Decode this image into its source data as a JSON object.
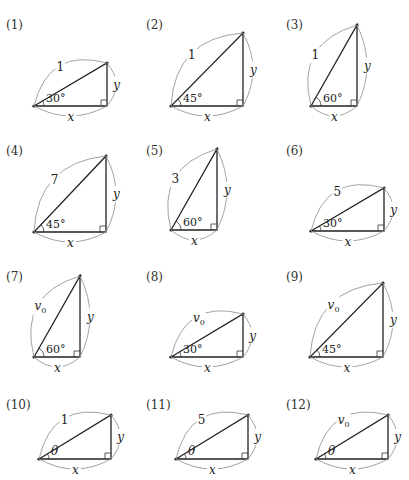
{
  "figure": {
    "colors": {
      "stroke": "#222222",
      "brace": "#999999",
      "background": "#ffffff"
    },
    "triangles": [
      {
        "number": "(1)",
        "hypotenuse": "1",
        "hyp_sub": "",
        "angle": "30°",
        "base_label": "x",
        "height_label": "y",
        "ax": 34,
        "ay": 106,
        "bx": 107,
        "ty": 63,
        "nx": 6,
        "ny": 20
      },
      {
        "number": "(2)",
        "hypotenuse": "1",
        "hyp_sub": "",
        "angle": "45°",
        "base_label": "x",
        "height_label": "y",
        "ax": 171,
        "ay": 106,
        "bx": 243,
        "ty": 33,
        "nx": 146,
        "ny": 20
      },
      {
        "number": "(3)",
        "hypotenuse": "1",
        "hyp_sub": "",
        "angle": "60°",
        "base_label": "x",
        "height_label": "y",
        "ax": 311,
        "ay": 106,
        "bx": 357,
        "ty": 25,
        "nx": 286,
        "ny": 20
      },
      {
        "number": "(4)",
        "hypotenuse": "7",
        "hyp_sub": "",
        "angle": "45°",
        "base_label": "x",
        "height_label": "y",
        "ax": 34,
        "ay": 232,
        "bx": 106,
        "ty": 156,
        "nx": 6,
        "ny": 146
      },
      {
        "number": "(5)",
        "hypotenuse": "3",
        "hyp_sub": "",
        "angle": "60°",
        "base_label": "x",
        "height_label": "y",
        "ax": 171,
        "ay": 230,
        "bx": 217,
        "ty": 149,
        "nx": 146,
        "ny": 146
      },
      {
        "number": "(6)",
        "hypotenuse": "5",
        "hyp_sub": "",
        "angle": "30°",
        "base_label": "x",
        "height_label": "y",
        "ax": 311,
        "ay": 231,
        "bx": 384,
        "ty": 188,
        "nx": 286,
        "ny": 146
      },
      {
        "number": "(7)",
        "hypotenuse": "v",
        "hyp_sub": "0",
        "angle": "60°",
        "base_label": "x",
        "height_label": "y",
        "ax": 34,
        "ay": 357,
        "bx": 80,
        "ty": 276,
        "nx": 6,
        "ny": 272
      },
      {
        "number": "(8)",
        "hypotenuse": "v",
        "hyp_sub": "0",
        "angle": "30°",
        "base_label": "x",
        "height_label": "y",
        "ax": 171,
        "ay": 357,
        "bx": 243,
        "ty": 314,
        "nx": 146,
        "ny": 272
      },
      {
        "number": "(9)",
        "hypotenuse": "v",
        "hyp_sub": "0",
        "angle": "45°",
        "base_label": "x",
        "height_label": "y",
        "ax": 310,
        "ay": 357,
        "bx": 383,
        "ty": 283,
        "nx": 286,
        "ny": 272
      },
      {
        "number": "(10)",
        "hypotenuse": "1",
        "hyp_sub": "",
        "angle": "θ",
        "base_label": "x",
        "height_label": "y",
        "ax": 39,
        "ay": 459,
        "bx": 111,
        "ty": 415,
        "nx": 6,
        "ny": 400
      },
      {
        "number": "(11)",
        "hypotenuse": "5",
        "hyp_sub": "",
        "angle": "θ",
        "base_label": "x",
        "height_label": "y",
        "ax": 176,
        "ay": 459,
        "bx": 248,
        "ty": 415,
        "nx": 146,
        "ny": 400
      },
      {
        "number": "(12)",
        "hypotenuse": "v",
        "hyp_sub": "0",
        "angle": "θ",
        "base_label": "x",
        "height_label": "y",
        "ax": 316,
        "ay": 459,
        "bx": 388,
        "ty": 415,
        "nx": 286,
        "ny": 400
      }
    ]
  }
}
